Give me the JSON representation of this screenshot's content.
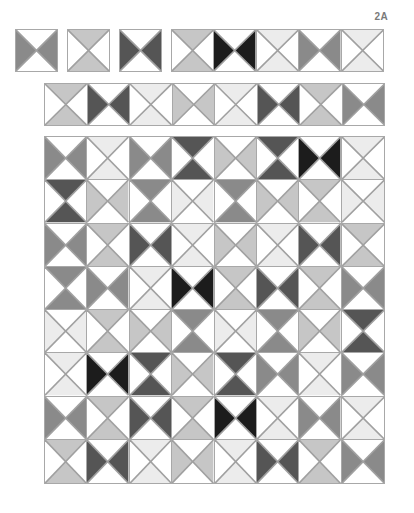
{
  "figure": {
    "label": "2A"
  },
  "shades": {
    "white": "#ffffff",
    "vlight": "#ececec",
    "light": "#c6c6c6",
    "mid": "#8a8a8a",
    "dark": "#555555",
    "black": "#1c1c1c",
    "line": "#a0a0a0"
  },
  "legend_note": "LR = left and right triangles shaded (hourglass on its side); TB = top and bottom triangles shaded",
  "top_row": {
    "single_blocks": [
      {
        "orientation": "LR",
        "shade": "mid"
      },
      {
        "orientation": "TB",
        "shade": "light"
      },
      {
        "orientation": "LR",
        "shade": "dark"
      }
    ],
    "strip": [
      {
        "orientation": "TB",
        "shade": "light"
      },
      {
        "orientation": "LR",
        "shade": "black"
      },
      {
        "orientation": "TB",
        "shade": "vlight"
      },
      {
        "orientation": "LR",
        "shade": "mid"
      },
      {
        "orientation": "TB",
        "shade": "vlight"
      }
    ]
  },
  "second_row": {
    "strip": [
      {
        "orientation": "TB",
        "shade": "light"
      },
      {
        "orientation": "LR",
        "shade": "dark"
      },
      {
        "orientation": "TB",
        "shade": "vlight"
      },
      {
        "orientation": "LR",
        "shade": "light"
      },
      {
        "orientation": "TB",
        "shade": "vlight"
      },
      {
        "orientation": "LR",
        "shade": "dark"
      },
      {
        "orientation": "TB",
        "shade": "light"
      },
      {
        "orientation": "LR",
        "shade": "mid"
      }
    ]
  },
  "quilt_grid": {
    "columns": 8,
    "rows": [
      [
        {
          "orientation": "LR",
          "shade": "mid"
        },
        {
          "orientation": "TB",
          "shade": "vlight"
        },
        {
          "orientation": "LR",
          "shade": "mid"
        },
        {
          "orientation": "TB",
          "shade": "dark"
        },
        {
          "orientation": "LR",
          "shade": "light"
        },
        {
          "orientation": "TB",
          "shade": "dark"
        },
        {
          "orientation": "LR",
          "shade": "black"
        },
        {
          "orientation": "TB",
          "shade": "vlight"
        }
      ],
      [
        {
          "orientation": "TB",
          "shade": "dark"
        },
        {
          "orientation": "LR",
          "shade": "light"
        },
        {
          "orientation": "TB",
          "shade": "mid"
        },
        {
          "orientation": "LR",
          "shade": "vlight"
        },
        {
          "orientation": "TB",
          "shade": "mid"
        },
        {
          "orientation": "LR",
          "shade": "light"
        },
        {
          "orientation": "TB",
          "shade": "light"
        },
        {
          "orientation": "LR",
          "shade": "vlight"
        }
      ],
      [
        {
          "orientation": "LR",
          "shade": "mid"
        },
        {
          "orientation": "TB",
          "shade": "light"
        },
        {
          "orientation": "LR",
          "shade": "dark"
        },
        {
          "orientation": "TB",
          "shade": "vlight"
        },
        {
          "orientation": "LR",
          "shade": "light"
        },
        {
          "orientation": "TB",
          "shade": "vlight"
        },
        {
          "orientation": "LR",
          "shade": "dark"
        },
        {
          "orientation": "TB",
          "shade": "light"
        }
      ],
      [
        {
          "orientation": "TB",
          "shade": "mid"
        },
        {
          "orientation": "LR",
          "shade": "mid"
        },
        {
          "orientation": "TB",
          "shade": "vlight"
        },
        {
          "orientation": "LR",
          "shade": "black"
        },
        {
          "orientation": "TB",
          "shade": "light"
        },
        {
          "orientation": "LR",
          "shade": "dark"
        },
        {
          "orientation": "TB",
          "shade": "light"
        },
        {
          "orientation": "LR",
          "shade": "mid"
        }
      ],
      [
        {
          "orientation": "LR",
          "shade": "vlight"
        },
        {
          "orientation": "TB",
          "shade": "light"
        },
        {
          "orientation": "LR",
          "shade": "light"
        },
        {
          "orientation": "TB",
          "shade": "mid"
        },
        {
          "orientation": "LR",
          "shade": "vlight"
        },
        {
          "orientation": "TB",
          "shade": "mid"
        },
        {
          "orientation": "LR",
          "shade": "light"
        },
        {
          "orientation": "TB",
          "shade": "dark"
        }
      ],
      [
        {
          "orientation": "TB",
          "shade": "vlight"
        },
        {
          "orientation": "LR",
          "shade": "black"
        },
        {
          "orientation": "TB",
          "shade": "dark"
        },
        {
          "orientation": "LR",
          "shade": "light"
        },
        {
          "orientation": "TB",
          "shade": "dark"
        },
        {
          "orientation": "LR",
          "shade": "mid"
        },
        {
          "orientation": "TB",
          "shade": "vlight"
        },
        {
          "orientation": "LR",
          "shade": "mid"
        }
      ],
      [
        {
          "orientation": "LR",
          "shade": "mid"
        },
        {
          "orientation": "TB",
          "shade": "light"
        },
        {
          "orientation": "LR",
          "shade": "dark"
        },
        {
          "orientation": "TB",
          "shade": "light"
        },
        {
          "orientation": "LR",
          "shade": "black"
        },
        {
          "orientation": "TB",
          "shade": "vlight"
        },
        {
          "orientation": "LR",
          "shade": "mid"
        },
        {
          "orientation": "TB",
          "shade": "vlight"
        }
      ],
      [
        {
          "orientation": "TB",
          "shade": "light"
        },
        {
          "orientation": "LR",
          "shade": "dark"
        },
        {
          "orientation": "TB",
          "shade": "vlight"
        },
        {
          "orientation": "LR",
          "shade": "light"
        },
        {
          "orientation": "TB",
          "shade": "vlight"
        },
        {
          "orientation": "LR",
          "shade": "dark"
        },
        {
          "orientation": "TB",
          "shade": "light"
        },
        {
          "orientation": "LR",
          "shade": "mid"
        }
      ]
    ]
  }
}
